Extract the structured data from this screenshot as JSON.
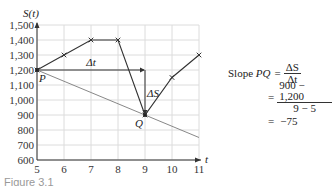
{
  "chart_data": {
    "type": "line",
    "title": "",
    "xlabel": "t",
    "ylabel": "S(t)",
    "xlim": [
      5,
      11
    ],
    "ylim": [
      600,
      1500
    ],
    "x_ticks": [
      "5",
      "6",
      "7",
      "8",
      "9",
      "10",
      "11"
    ],
    "y_ticks": [
      "600",
      "700",
      "800",
      "900",
      "1,000",
      "1,100",
      "1,200",
      "1,300",
      "1,400",
      "1,500"
    ],
    "grid": true,
    "series": [
      {
        "name": "S(t)",
        "x": [
          5,
          6,
          7,
          8,
          9,
          10,
          11
        ],
        "values": [
          1200,
          1300,
          1400,
          1400,
          900,
          1150,
          1300
        ],
        "color": "#333333",
        "markers": "x"
      },
      {
        "name": "Secant PQ",
        "x": [
          5,
          11
        ],
        "values": [
          1200,
          750
        ],
        "color": "#888888"
      }
    ],
    "annotations": [
      {
        "text": "P",
        "x": 5,
        "y": 1200
      },
      {
        "text": "Q",
        "x": 9,
        "y": 900
      },
      {
        "text": "Δt",
        "from": [
          5,
          1200
        ],
        "to": [
          9,
          1200
        ]
      },
      {
        "text": "ΔS",
        "from": [
          9,
          1200
        ],
        "to": [
          9,
          900
        ]
      }
    ]
  },
  "equation": {
    "lhs": "Slope PQ",
    "step1_num": "ΔS",
    "step1_den": "Δt",
    "step2_num": "900 − 1,200",
    "step2_den": "9 − 5",
    "result": "−75",
    "equals": "="
  },
  "labels": {
    "y_axis": "S(t)",
    "x_axis": "t",
    "point_p": "P",
    "point_q": "Q",
    "delta_t": "Δt",
    "delta_s": "ΔS"
  },
  "caption": "Figure 3.1"
}
